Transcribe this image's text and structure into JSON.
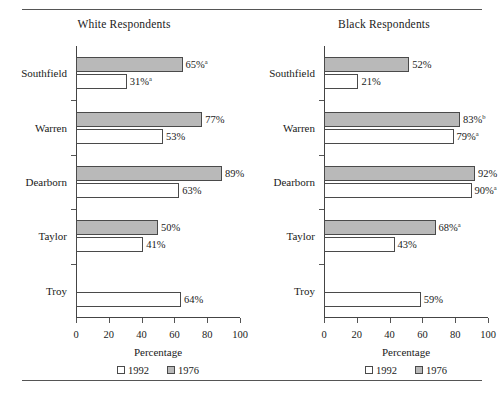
{
  "figure": {
    "rule_top": "",
    "rule_bottom": ""
  },
  "axis": {
    "xlabel": "Percentage",
    "ticks": [
      "0",
      "20",
      "40",
      "60",
      "80",
      "100"
    ]
  },
  "legend": {
    "items": [
      {
        "label": "1992",
        "swatch": "open-white-square"
      },
      {
        "label": "1976",
        "swatch": "filled-gray-square"
      }
    ]
  },
  "colors": {
    "bar_1976": "#b9b9b9",
    "bar_1992": "#ffffff",
    "bar_outline": "#4a4a4a",
    "axis": "#444444",
    "rule": "#555555"
  },
  "chart_data": {
    "type": "bar",
    "orientation": "horizontal",
    "title": "",
    "xlabel": "Percentage",
    "ylabel": "",
    "xlim": [
      0,
      100
    ],
    "xticks": [
      0,
      20,
      40,
      60,
      80,
      100
    ],
    "grid": false,
    "legend_position": "bottom",
    "panels": [
      {
        "title": "White Respondents",
        "categories": [
          "Southfield",
          "Warren",
          "Dearborn",
          "Taylor",
          "Troy"
        ],
        "series": [
          {
            "name": "1976",
            "values": [
              65,
              77,
              89,
              50,
              null
            ],
            "labels": [
              "65%",
              "77%",
              "89%",
              "50%",
              ""
            ],
            "footnotes": [
              "a",
              "",
              "",
              "",
              ""
            ]
          },
          {
            "name": "1992",
            "values": [
              31,
              53,
              63,
              41,
              64
            ],
            "labels": [
              "31%",
              "53%",
              "63%",
              "41%",
              "64%"
            ],
            "footnotes": [
              "a",
              "",
              "",
              "",
              ""
            ]
          }
        ]
      },
      {
        "title": "Black Respondents",
        "categories": [
          "Southfield",
          "Warren",
          "Dearborn",
          "Taylor",
          "Troy"
        ],
        "series": [
          {
            "name": "1976",
            "values": [
              52,
              83,
              92,
              68,
              null
            ],
            "labels": [
              "52%",
              "83%",
              "92%",
              "68%",
              ""
            ],
            "footnotes": [
              "",
              "b",
              "",
              "a",
              ""
            ]
          },
          {
            "name": "1992",
            "values": [
              21,
              79,
              90,
              43,
              59
            ],
            "labels": [
              "21%",
              "79%",
              "90%",
              "43%",
              "59%"
            ],
            "footnotes": [
              "",
              "a",
              "a",
              "",
              ""
            ]
          }
        ]
      }
    ]
  }
}
